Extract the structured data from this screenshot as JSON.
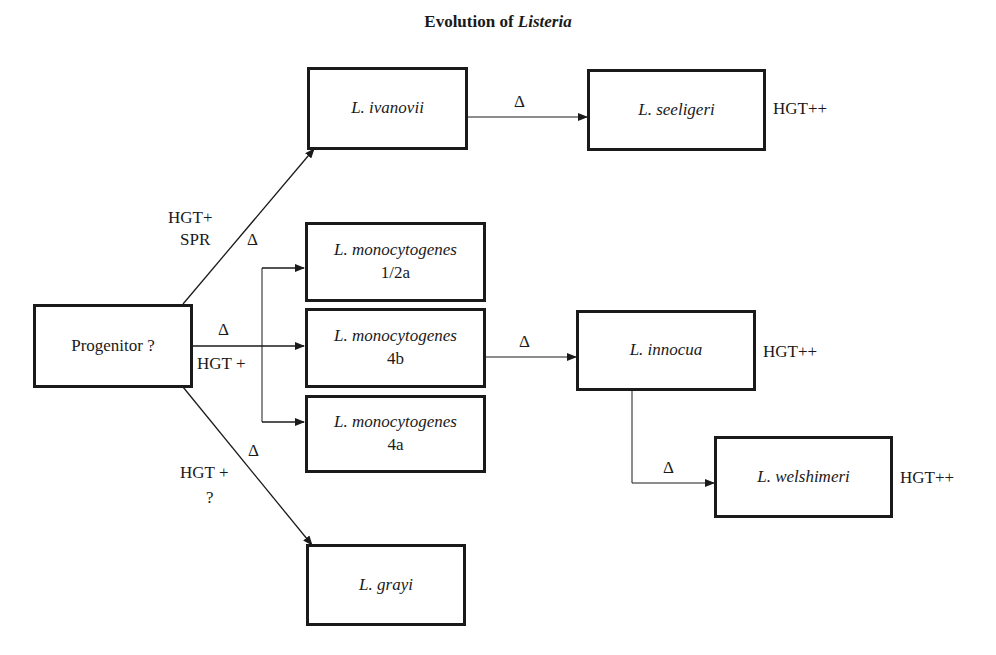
{
  "title": {
    "prefix": "Evolution of ",
    "genus": "Listeria"
  },
  "nodes": {
    "progenitor": {
      "label": "Progenitor ?"
    },
    "ivanovii": {
      "label": "L. ivanovii"
    },
    "seeligeri": {
      "label": "L. seeligeri",
      "annotation": "HGT++"
    },
    "mono_12a": {
      "label": "L. monocytogenes",
      "serotype": "1/2a"
    },
    "mono_4b": {
      "label": "L. monocytogenes",
      "serotype": "4b"
    },
    "mono_4a": {
      "label": "L. monocytogenes",
      "serotype": "4a"
    },
    "innocua": {
      "label": "L. innocua",
      "annotation": "HGT++"
    },
    "welshimeri": {
      "label": "L. welshimeri",
      "annotation": "HGT++"
    },
    "grayi": {
      "label": "L. grayi"
    }
  },
  "edges": {
    "progenitor_to_ivanovii": {
      "line1": "HGT+",
      "line2": "SPR",
      "delta": "Δ"
    },
    "progenitor_to_monocytogenes": {
      "delta": "Δ",
      "label": "HGT +"
    },
    "progenitor_to_grayi": {
      "line1": "HGT +",
      "line2": "?",
      "delta": "Δ"
    },
    "ivanovii_to_seeligeri": {
      "delta": "Δ"
    },
    "mono4b_to_innocua": {
      "delta": "Δ"
    },
    "innocua_to_welshimeri": {
      "delta": "Δ"
    }
  }
}
